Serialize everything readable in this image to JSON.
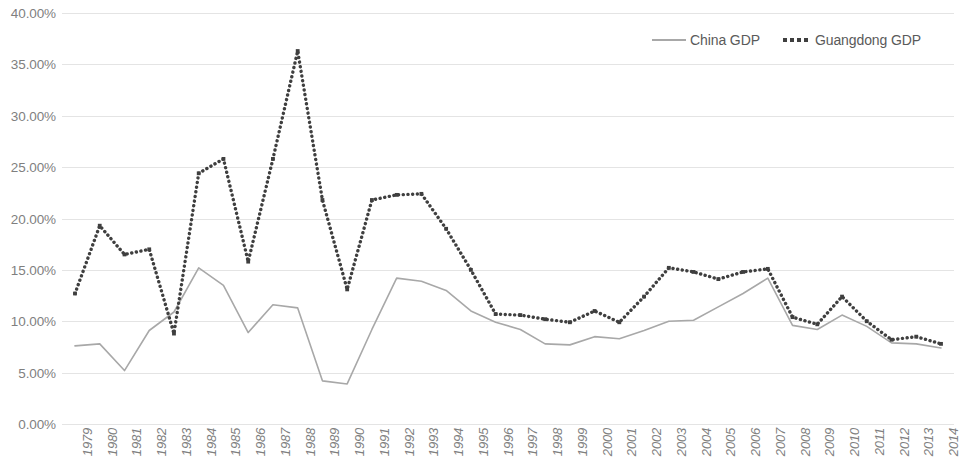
{
  "chart_data": {
    "type": "line",
    "title": "",
    "subtitle": "",
    "xlabel": "",
    "ylabel": "",
    "grid": true,
    "legend_position": "top-right",
    "ylim": [
      0,
      40
    ],
    "ytick_step": 5,
    "ytick_labels": [
      "0.00%",
      "5.00%",
      "10.00%",
      "15.00%",
      "20.00%",
      "25.00%",
      "30.00%",
      "35.00%",
      "40.00%"
    ],
    "ytick_values": [
      0,
      5,
      10,
      15,
      20,
      25,
      30,
      35,
      40
    ],
    "value_suffix": "%",
    "categories": [
      "1979",
      "1980",
      "1981",
      "1982",
      "1983",
      "1984",
      "1985",
      "1986",
      "1987",
      "1988",
      "1989",
      "1990",
      "1991",
      "1992",
      "1993",
      "1994",
      "1995",
      "1996",
      "1997",
      "1998",
      "1999",
      "2000",
      "2001",
      "2002",
      "2003",
      "2004",
      "2005",
      "2006",
      "2007",
      "2008",
      "2009",
      "2010",
      "2011",
      "2012",
      "2013",
      "2014"
    ],
    "series": [
      {
        "name": "China GDP",
        "color": "#a8a8a8",
        "style": "solid",
        "marker": "none",
        "values": [
          7.6,
          7.8,
          5.2,
          9.1,
          10.9,
          15.2,
          13.5,
          8.9,
          11.6,
          11.3,
          4.2,
          3.9,
          9.2,
          14.2,
          13.9,
          13.0,
          11.0,
          9.9,
          9.2,
          7.8,
          7.7,
          8.5,
          8.3,
          9.1,
          10.0,
          10.1,
          11.4,
          12.7,
          14.2,
          9.6,
          9.2,
          10.6,
          9.5,
          7.9,
          7.8,
          7.4
        ]
      },
      {
        "name": "Guangdong GDP",
        "color": "#3f3f3f",
        "style": "dotted",
        "marker": "square",
        "values": [
          12.7,
          19.3,
          16.5,
          17.0,
          8.8,
          24.4,
          25.8,
          15.8,
          25.8,
          36.3,
          21.8,
          13.1,
          21.8,
          22.3,
          22.4,
          19.0,
          15.0,
          10.7,
          10.6,
          10.2,
          9.9,
          11.0,
          9.9,
          12.4,
          15.2,
          14.8,
          14.1,
          14.8,
          15.1,
          10.4,
          9.7,
          12.4,
          10.0,
          8.2,
          8.5,
          7.8
        ]
      }
    ]
  },
  "legend": {
    "entries": [
      {
        "label": "China GDP"
      },
      {
        "label": "Guangdong GDP"
      }
    ]
  },
  "colors": {
    "china_line": "#a8a8a8",
    "guangdong_line": "#3f3f3f",
    "gridline": "#e4e4e4",
    "axis_text": "#7f7f7f",
    "background": "#ffffff"
  }
}
